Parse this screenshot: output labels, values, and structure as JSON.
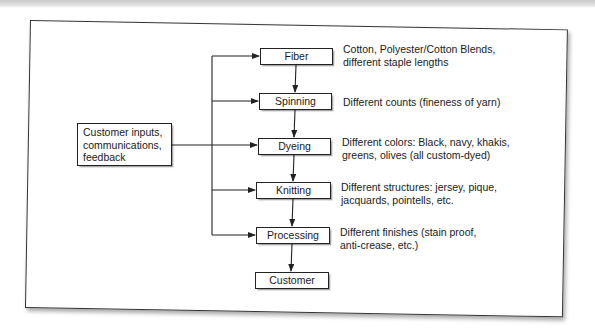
{
  "diagram": {
    "input_box": {
      "label": "Customer inputs,\ncommunications,\nfeedback"
    },
    "steps": [
      {
        "label": "Fiber",
        "description": "Cotton, Polyester/Cotton Blends,\ndifferent staple lengths"
      },
      {
        "label": "Spinning",
        "description": "Different counts (fineness of yarn)"
      },
      {
        "label": "Dyeing",
        "description": "Different colors: Black, navy, khakis,\ngreens, olives (all custom-dyed)"
      },
      {
        "label": "Knitting",
        "description": "Different structures: jersey, pique,\njacquards, pointells, etc."
      },
      {
        "label": "Processing",
        "description": "Different finishes (stain proof,\nanti-crease, etc.)"
      },
      {
        "label": "Customer",
        "description": ""
      }
    ]
  }
}
